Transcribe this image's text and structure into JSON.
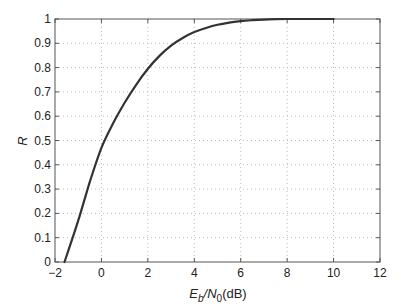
{
  "chart_data": {
    "type": "line",
    "title": "",
    "xlabel": "E_b/N_0(dB)",
    "xlabel_parts": {
      "e": "E",
      "b": "b",
      "slash": "/",
      "n": "N",
      "zero": "0",
      "unit": "(dB)"
    },
    "ylabel": "R",
    "xlim": [
      -2,
      12
    ],
    "ylim": [
      0,
      1
    ],
    "grid": true,
    "legend": null,
    "x_ticks": [
      -2,
      0,
      2,
      4,
      6,
      8,
      10,
      12
    ],
    "x_tick_labels": [
      "−2",
      "0",
      "2",
      "4",
      "6",
      "8",
      "10",
      "12"
    ],
    "y_ticks": [
      0,
      0.1,
      0.2,
      0.3,
      0.4,
      0.5,
      0.6,
      0.7,
      0.8,
      0.9,
      1
    ],
    "y_tick_labels": [
      "0",
      "0.1",
      "0.2",
      "0.3",
      "0.4",
      "0.5",
      "0.6",
      "0.7",
      "0.8",
      "0.9",
      "1"
    ],
    "series": [
      {
        "name": "R",
        "color": "#333333",
        "x": [
          -1.59,
          -1.0,
          -0.5,
          0,
          0.5,
          1,
          1.5,
          2,
          2.5,
          3,
          3.5,
          4,
          4.5,
          5,
          5.5,
          6,
          6.5,
          7,
          7.5,
          8,
          8.5,
          9,
          10
        ],
        "y": [
          0.0,
          0.17,
          0.33,
          0.47,
          0.57,
          0.655,
          0.73,
          0.795,
          0.848,
          0.89,
          0.922,
          0.946,
          0.963,
          0.976,
          0.985,
          0.991,
          0.995,
          0.997,
          0.999,
          1.0,
          1.0,
          1.0,
          1.0
        ]
      }
    ]
  }
}
